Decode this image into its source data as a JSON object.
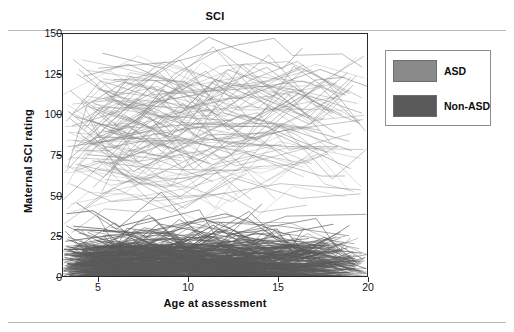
{
  "figure": {
    "title": "SCI"
  },
  "axes": {
    "y": {
      "label": "Maternal SCI rating",
      "ticks": [
        0,
        25,
        50,
        75,
        100,
        125,
        150
      ],
      "min": 0,
      "max": 150
    },
    "x": {
      "label": "Age at assessment",
      "ticks": [
        5,
        10,
        15,
        20
      ],
      "min": 3,
      "max": 20
    }
  },
  "legend": {
    "items": [
      {
        "label": "ASD",
        "color": "#8a8a8a"
      },
      {
        "label": "Non-ASD",
        "color": "#5a5a5a"
      }
    ]
  },
  "chart_data": {
    "type": "line",
    "title": "SCI",
    "subtitle": "",
    "xlabel": "Age at assessment",
    "ylabel": "Maternal SCI rating",
    "xlim": [
      3,
      20
    ],
    "ylim": [
      0,
      150
    ],
    "xticks": [
      5,
      10,
      15,
      20
    ],
    "yticks": [
      0,
      25,
      50,
      75,
      100,
      125,
      150
    ],
    "grid": false,
    "legend_position": "right-outside",
    "series": [
      {
        "name": "ASD",
        "color": "#8a8a8a",
        "n_lines": 120,
        "y_range": [
          25,
          148
        ],
        "y_typical": [
          60,
          120
        ],
        "trajectories": [
          {
            "x": [
              3.2,
              5.1,
              7.4,
              9.8,
              12.2,
              15.0,
              17.6,
              19.7
            ],
            "y": [
              96,
              121,
              113,
              104,
              128,
              116,
              109,
              101
            ]
          },
          {
            "x": [
              3.5,
              6.0,
              8.3,
              10.9,
              13.4,
              16.1,
              18.8
            ],
            "y": [
              78,
              102,
              127,
              98,
              121,
              133,
              112
            ]
          },
          {
            "x": [
              4.1,
              6.6,
              9.2,
              11.7,
              14.3,
              17.0,
              19.4
            ],
            "y": [
              110,
              88,
              125,
              140,
              118,
              97,
              124
            ]
          },
          {
            "x": [
              3.1,
              5.6,
              8.0,
              10.4,
              13.0,
              15.7,
              18.2
            ],
            "y": [
              64,
              95,
              118,
              86,
              131,
              107,
              89
            ]
          },
          {
            "x": [
              3.8,
              6.3,
              8.8,
              11.3,
              13.9,
              16.5,
              19.0
            ],
            "y": [
              125,
              107,
              92,
              120,
              104,
              128,
              113
            ]
          },
          {
            "x": [
              4.4,
              7.0,
              9.5,
              12.0,
              14.6,
              17.3,
              19.8
            ],
            "y": [
              88,
              116,
              134,
              101,
              92,
              119,
              136
            ]
          },
          {
            "x": [
              3.3,
              5.9,
              8.4,
              11.0,
              13.6,
              16.2,
              18.6
            ],
            "y": [
              102,
              79,
              110,
              127,
              95,
              113,
              100
            ]
          },
          {
            "x": [
              4.0,
              6.5,
              9.0,
              11.5,
              14.1,
              16.8,
              19.2
            ],
            "y": [
              70,
              99,
              86,
              122,
              108,
              94,
              118
            ]
          },
          {
            "x": [
              3.6,
              6.1,
              8.6,
              11.2,
              13.7,
              16.4,
              18.9
            ],
            "y": [
              134,
              112,
              129,
              96,
              117,
              103,
              126
            ]
          },
          {
            "x": [
              4.7,
              7.2,
              9.7,
              12.4,
              15.0,
              17.7,
              19.9
            ],
            "y": [
              55,
              83,
              107,
              75,
              99,
              121,
              90
            ]
          },
          {
            "x": [
              3.4,
              5.8,
              8.2,
              10.7,
              13.2,
              15.9,
              18.4
            ],
            "y": [
              115,
              93,
              121,
              108,
              85,
              130,
              111
            ]
          },
          {
            "x": [
              4.2,
              6.8,
              9.3,
              11.9,
              14.5,
              17.1,
              19.5
            ],
            "y": [
              91,
              124,
              100,
              113,
              137,
              106,
              95
            ]
          },
          {
            "x": [
              3.0,
              5.4,
              7.9,
              10.3,
              12.8,
              15.5,
              18.0
            ],
            "y": [
              47,
              72,
              98,
              66,
              90,
              114,
              82
            ]
          },
          {
            "x": [
              3.9,
              6.4,
              8.9,
              11.4,
              14.0,
              16.7,
              19.1
            ],
            "y": [
              128,
              104,
              119,
              142,
              111,
              98,
              123
            ]
          },
          {
            "x": [
              4.5,
              7.1,
              9.6,
              12.1,
              14.8,
              17.4,
              19.6
            ],
            "y": [
              83,
              110,
              89,
              126,
              102,
              117,
              94
            ]
          }
        ]
      },
      {
        "name": "Non-ASD",
        "color": "#5a5a5a",
        "n_lines": 180,
        "y_range": [
          0,
          60
        ],
        "y_typical": [
          2,
          25
        ],
        "trajectories": [
          {
            "x": [
              3.1,
              5.2,
              7.5,
              9.9,
              12.3,
              15.1,
              17.7,
              19.8
            ],
            "y": [
              14,
              8,
              19,
              6,
              12,
              4,
              9,
              3
            ]
          },
          {
            "x": [
              3.4,
              5.8,
              8.1,
              10.6,
              13.1,
              15.8,
              18.3
            ],
            "y": [
              22,
              11,
              27,
              15,
              7,
              18,
              5
            ]
          },
          {
            "x": [
              4.0,
              6.4,
              8.9,
              11.4,
              14.0,
              16.6,
              19.1
            ],
            "y": [
              6,
              17,
              9,
              24,
              11,
              3,
              13
            ]
          },
          {
            "x": [
              3.2,
              5.5,
              7.8,
              10.2,
              12.7,
              15.4,
              17.9
            ],
            "y": [
              31,
              19,
              38,
              12,
              25,
              8,
              16
            ]
          },
          {
            "x": [
              3.7,
              6.2,
              8.7,
              11.1,
              13.5,
              16.3,
              18.7
            ],
            "y": [
              9,
              4,
              14,
              7,
              21,
              5,
              10
            ]
          },
          {
            "x": [
              4.3,
              6.9,
              9.4,
              11.8,
              14.4,
              17.2,
              19.6
            ],
            "y": [
              18,
              26,
              11,
              33,
              16,
              22,
              8
            ]
          },
          {
            "x": [
              3.0,
              5.3,
              7.7,
              10.1,
              12.6,
              15.2,
              17.8
            ],
            "y": [
              3,
              12,
              5,
              18,
              8,
              14,
              6
            ]
          },
          {
            "x": [
              3.8,
              6.0,
              8.5,
              10.9,
              13.3,
              16.0,
              18.5
            ],
            "y": [
              45,
              29,
              52,
              21,
              36,
              14,
              27
            ]
          },
          {
            "x": [
              4.6,
              7.1,
              9.6,
              12.2,
              14.7,
              17.5,
              19.9
            ],
            "y": [
              11,
              7,
              20,
              4,
              15,
              9,
              2
            ]
          },
          {
            "x": [
              3.3,
              5.7,
              8.0,
              10.5,
              13.0,
              15.6,
              18.1
            ],
            "y": [
              24,
              15,
              9,
              28,
              13,
              19,
              7
            ]
          },
          {
            "x": [
              4.1,
              6.6,
              9.1,
              11.6,
              14.2,
              16.9,
              19.3
            ],
            "y": [
              7,
              21,
              13,
              5,
              17,
              10,
              4
            ]
          },
          {
            "x": [
              3.5,
              5.9,
              8.4,
              10.8,
              13.4,
              16.1,
              18.6
            ],
            "y": [
              16,
              33,
              8,
              23,
              40,
              12,
              20
            ]
          },
          {
            "x": [
              3.6,
              6.1,
              8.6,
              11.0,
              13.8,
              16.5,
              19.0
            ],
            "y": [
              5,
              10,
              3,
              14,
              6,
              11,
              2
            ]
          },
          {
            "x": [
              4.4,
              7.0,
              9.5,
              12.0,
              14.9,
              17.6,
              19.7
            ],
            "y": [
              27,
              13,
              35,
              18,
              9,
              24,
              11
            ]
          },
          {
            "x": [
              3.9,
              6.5,
              9.0,
              11.5,
              14.1,
              16.8,
              19.2
            ],
            "y": [
              12,
              6,
              17,
              8,
              22,
              5,
              15
            ]
          }
        ]
      }
    ]
  }
}
